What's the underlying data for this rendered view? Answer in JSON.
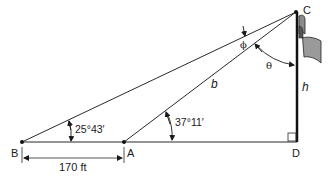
{
  "diagram": {
    "type": "trigonometry-flagpole",
    "points": {
      "B": {
        "label": "B"
      },
      "A": {
        "label": "A"
      },
      "D": {
        "label": "D"
      },
      "C": {
        "label": "C"
      }
    },
    "angles": {
      "at_B": "25°43′",
      "at_A": "37°11′",
      "phi": "ϕ",
      "theta": "θ"
    },
    "segments": {
      "AC": "b",
      "CD": "h",
      "BA": "170 ft"
    },
    "colors": {
      "line": "#2a2a2a",
      "pole": "#111111",
      "flag_fill": "#9a9a9a",
      "flag_dark": "#555555",
      "background": "#ffffff"
    }
  }
}
